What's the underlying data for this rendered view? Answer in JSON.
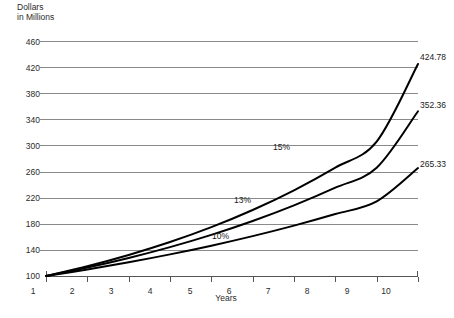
{
  "chart_data": {
    "type": "line",
    "title": "",
    "ylabel": "Dollars\nin Millions",
    "xlabel": "Years",
    "x": [
      1,
      2,
      3,
      4,
      5,
      6,
      7,
      8,
      9,
      10
    ],
    "xlim": [
      1,
      10
    ],
    "ylim": [
      100,
      460
    ],
    "yticks": [
      100,
      140,
      180,
      220,
      260,
      300,
      340,
      380,
      420,
      460
    ],
    "xticks": [
      1,
      2,
      3,
      4,
      5,
      6,
      7,
      8,
      9,
      10
    ],
    "grid": true,
    "legend": "inline-annotations",
    "series": [
      {
        "name": "15%",
        "label": "15%",
        "end_value_label": "424.78",
        "values": [
          100.0,
          115.0,
          132.25,
          152.09,
          174.9,
          201.14,
          231.31,
          266.0,
          305.9,
          424.78
        ]
      },
      {
        "name": "13%",
        "label": "13%",
        "end_value_label": "352.36",
        "values": [
          100.0,
          113.0,
          127.69,
          144.29,
          163.05,
          184.24,
          208.19,
          235.26,
          265.84,
          352.36
        ]
      },
      {
        "name": "10%",
        "label": "10%",
        "end_value_label": "265.33",
        "values": [
          100.0,
          110.0,
          121.0,
          133.1,
          146.41,
          161.05,
          177.16,
          194.87,
          214.36,
          265.33
        ]
      }
    ]
  },
  "axes": {
    "y_caption_line1": "Dollars",
    "y_caption_line2": "in Millions",
    "x_caption": "Years",
    "y_tick_labels": [
      "460",
      "420",
      "380",
      "340",
      "300",
      "260",
      "220",
      "180",
      "140",
      "100"
    ],
    "x_tick_labels": [
      "1",
      "2",
      "3",
      "4",
      "5",
      "6",
      "7",
      "8",
      "9",
      "10"
    ]
  },
  "annotations": {
    "series_15_label": "15%",
    "series_13_label": "13%",
    "series_10_label": "10%",
    "end_label_15": "424.78",
    "end_label_13": "352.36",
    "end_label_10": "265.33"
  },
  "colors": {
    "background": "#ffffff",
    "gridline": "#8a8a8a",
    "axis": "#555555",
    "curve": "#000000",
    "text": "#231f20"
  }
}
